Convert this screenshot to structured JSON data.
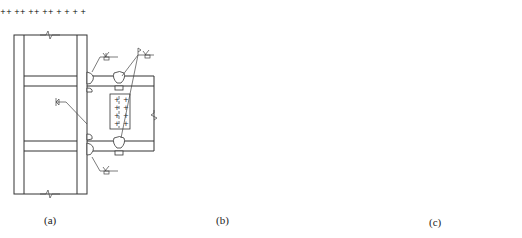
{
  "figure": {
    "panels": [
      {
        "id": "a",
        "caption": "(a)",
        "description": "Beam-to-column connection with welded flanges and bolted web shear plate"
      },
      {
        "id": "b",
        "caption": "(b)",
        "description": "Beam-to-column connection with bolted web plate welded to column"
      },
      {
        "id": "c",
        "caption": "(c)",
        "description": "Beam connection to column with haunched/tapered transition, plan and elevation"
      }
    ],
    "bolt_mark": "+",
    "line_color": "#333333",
    "background": "#ffffff"
  }
}
